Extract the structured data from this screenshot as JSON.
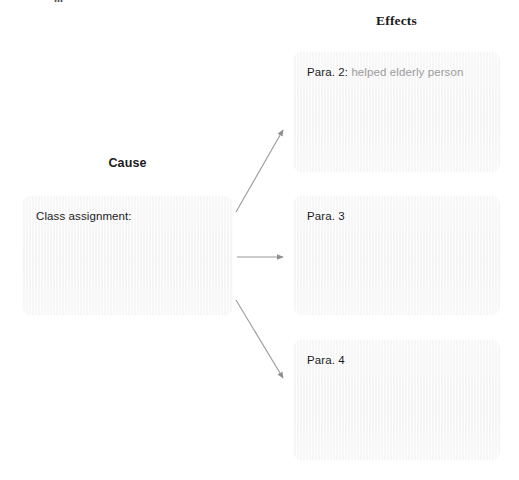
{
  "diagram": {
    "title_fragment": "...",
    "cause_heading": "Cause",
    "effects_heading": "Effects",
    "cause_box": {
      "label": "Class assignment:",
      "value": ""
    },
    "effect_boxes": [
      {
        "label": "Para. 2:",
        "value": "helped elderly person"
      },
      {
        "label": "Para. 3",
        "value": ""
      },
      {
        "label": "Para. 4",
        "value": ""
      }
    ],
    "arrows": [
      {
        "name": "arrow-cause-to-effect-1",
        "direction": "up-right"
      },
      {
        "name": "arrow-cause-to-effect-2",
        "direction": "right"
      },
      {
        "name": "arrow-cause-to-effect-3",
        "direction": "down-right"
      }
    ],
    "colors": {
      "background": "#ffffff",
      "box_fill": "#f6f6f6",
      "text_primary": "#1c1c1c",
      "text_muted": "#9b9b9b",
      "arrow": "#8f8f8f"
    }
  }
}
